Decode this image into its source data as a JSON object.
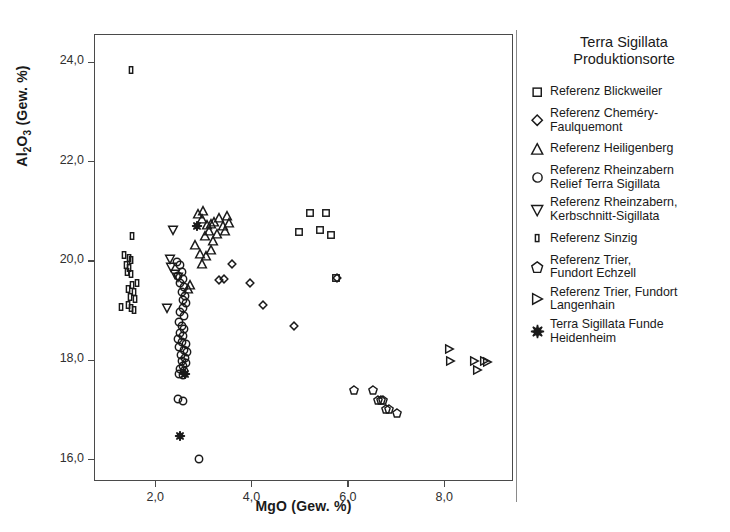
{
  "chart_data": {
    "type": "scatter",
    "title": "",
    "xlabel": "MgO (Gew. %)",
    "ylabel_html": "Al2O3 (Gew. %)",
    "ylabel_main": "Al",
    "ylabel_sub1": "2",
    "ylabel_mid": "O",
    "ylabel_sub2": "3",
    "ylabel_tail": " (Gew. %)",
    "xlim": [
      0.75,
      9.45
    ],
    "ylim": [
      15.55,
      24.55
    ],
    "xticks": [
      2.0,
      4.0,
      6.0,
      8.0
    ],
    "xticklabels": [
      "2,0",
      "4,0",
      "6,0",
      "8,0"
    ],
    "yticks": [
      16.0,
      18.0,
      20.0,
      22.0,
      24.0
    ],
    "yticklabels": [
      "16,0",
      "18,0",
      "20,0",
      "22,0",
      "24,0"
    ],
    "grid": false,
    "legend_position": "right",
    "marker_color": "#1a1a1a",
    "series": [
      {
        "name": "Referenz Blickweiler",
        "marker": "square",
        "points": [
          [
            4.99,
            20.58
          ],
          [
            5.22,
            20.97
          ],
          [
            5.42,
            20.62
          ],
          [
            5.55,
            20.97
          ],
          [
            5.66,
            20.52
          ],
          [
            5.75,
            19.66
          ]
        ]
      },
      {
        "name": "Referenz Chemery-Faulquemont",
        "marker": "diamond",
        "points": [
          [
            3.32,
            19.62
          ],
          [
            3.42,
            19.63
          ],
          [
            3.6,
            19.94
          ],
          [
            3.96,
            19.56
          ],
          [
            4.24,
            19.12
          ],
          [
            4.88,
            18.7
          ],
          [
            5.78,
            19.65
          ]
        ]
      },
      {
        "name": "Referenz Heiligenberg",
        "marker": "triangle-up",
        "points": [
          [
            2.83,
            20.32
          ],
          [
            2.88,
            20.95
          ],
          [
            2.97,
            20.85
          ],
          [
            3.0,
            21.0
          ],
          [
            3.04,
            20.5
          ],
          [
            3.08,
            20.73
          ],
          [
            3.12,
            20.6
          ],
          [
            3.16,
            20.74
          ],
          [
            3.2,
            20.4
          ],
          [
            3.22,
            20.78
          ],
          [
            3.28,
            20.55
          ],
          [
            3.33,
            20.86
          ],
          [
            3.4,
            20.7
          ],
          [
            3.44,
            20.6
          ],
          [
            3.5,
            20.9
          ],
          [
            3.54,
            20.77
          ],
          [
            2.93,
            20.15
          ],
          [
            3.05,
            20.1
          ],
          [
            2.98,
            19.93
          ],
          [
            3.15,
            20.22
          ],
          [
            2.73,
            19.52
          ],
          [
            2.68,
            19.43
          ]
        ]
      },
      {
        "name": "Referenz Rheinzabern Relief Terra Sigillata",
        "marker": "circle",
        "points": [
          [
            2.46,
            19.98
          ],
          [
            2.52,
            19.92
          ],
          [
            2.55,
            19.78
          ],
          [
            2.48,
            19.7
          ],
          [
            2.58,
            19.63
          ],
          [
            2.52,
            19.55
          ],
          [
            2.6,
            19.48
          ],
          [
            2.56,
            19.38
          ],
          [
            2.62,
            19.3
          ],
          [
            2.57,
            19.22
          ],
          [
            2.64,
            19.15
          ],
          [
            2.58,
            19.05
          ],
          [
            2.51,
            18.97
          ],
          [
            2.6,
            18.9
          ],
          [
            2.49,
            18.78
          ],
          [
            2.55,
            18.7
          ],
          [
            2.6,
            18.63
          ],
          [
            2.52,
            18.55
          ],
          [
            2.58,
            18.48
          ],
          [
            2.47,
            18.42
          ],
          [
            2.56,
            18.36
          ],
          [
            2.63,
            18.32
          ],
          [
            2.5,
            18.26
          ],
          [
            2.59,
            18.2
          ],
          [
            2.66,
            18.16
          ],
          [
            2.53,
            18.1
          ],
          [
            2.61,
            18.05
          ],
          [
            2.55,
            17.98
          ],
          [
            2.64,
            17.94
          ],
          [
            2.58,
            17.88
          ],
          [
            2.52,
            17.82
          ],
          [
            2.6,
            17.78
          ],
          [
            2.49,
            17.72
          ],
          [
            2.57,
            17.7
          ],
          [
            2.47,
            17.22
          ],
          [
            2.57,
            17.18
          ],
          [
            2.9,
            16.02
          ]
        ]
      },
      {
        "name": "Referenz Rheinzabern, Kerbschnitt-Sigillata",
        "marker": "triangle-down",
        "points": [
          [
            2.37,
            20.63
          ],
          [
            2.3,
            20.05
          ],
          [
            2.33,
            19.88
          ],
          [
            2.42,
            19.74
          ],
          [
            2.47,
            19.67
          ],
          [
            2.25,
            19.05
          ]
        ]
      },
      {
        "name": "Referenz Sinzig",
        "marker": "rect-tall",
        "points": [
          [
            1.5,
            23.85
          ],
          [
            1.52,
            20.5
          ],
          [
            1.36,
            20.12
          ],
          [
            1.45,
            20.06
          ],
          [
            1.49,
            20.02
          ],
          [
            1.4,
            19.92
          ],
          [
            1.46,
            19.86
          ],
          [
            1.42,
            19.78
          ],
          [
            1.5,
            19.74
          ],
          [
            1.52,
            19.52
          ],
          [
            1.62,
            19.55
          ],
          [
            1.44,
            19.44
          ],
          [
            1.56,
            19.38
          ],
          [
            1.47,
            19.28
          ],
          [
            1.58,
            19.24
          ],
          [
            1.28,
            19.08
          ],
          [
            1.44,
            19.12
          ],
          [
            1.5,
            19.05
          ],
          [
            1.55,
            19.02
          ]
        ]
      },
      {
        "name": "Referenz Trier, Fundort Echzell",
        "marker": "pentagon",
        "points": [
          [
            6.12,
            17.4
          ],
          [
            6.52,
            17.4
          ],
          [
            6.62,
            17.2
          ],
          [
            6.68,
            17.2
          ],
          [
            6.74,
            17.2
          ],
          [
            6.8,
            17.02
          ],
          [
            6.86,
            17.02
          ],
          [
            7.02,
            16.94
          ]
        ]
      },
      {
        "name": "Referenz Trier, Fundort Langenhain",
        "marker": "triangle-right",
        "points": [
          [
            8.1,
            18.22
          ],
          [
            8.12,
            17.98
          ],
          [
            8.62,
            17.98
          ],
          [
            8.82,
            17.99
          ],
          [
            8.88,
            17.97
          ],
          [
            8.68,
            17.8
          ]
        ]
      },
      {
        "name": "Terra Sigillata Funde Heidenheim",
        "marker": "star",
        "points": [
          [
            2.87,
            20.7
          ],
          [
            2.62,
            17.72
          ],
          [
            2.52,
            16.48
          ]
        ]
      }
    ]
  },
  "legend": {
    "title": "Terra Sigillata\nProduktionsorte",
    "items": [
      {
        "label": "Referenz Blickweiler",
        "marker": "square"
      },
      {
        "label": "Referenz Cheméry-\nFaulquemont",
        "marker": "diamond"
      },
      {
        "label": "Referenz Heiligenberg",
        "marker": "triangle-up"
      },
      {
        "label": "Referenz Rheinzabern\nRelief Terra Sigillata",
        "marker": "circle"
      },
      {
        "label": "Referenz Rheinzabern,\nKerbschnitt-Sigillata",
        "marker": "triangle-down"
      },
      {
        "label": "Referenz Sinzig",
        "marker": "rect-tall"
      },
      {
        "label": "Referenz Trier,\nFundort Echzell",
        "marker": "pentagon"
      },
      {
        "label": "Referenz Trier, Fundort\nLangenhain",
        "marker": "triangle-right"
      },
      {
        "label": "Terra Sigillata Funde\nHeidenheim",
        "marker": "star"
      }
    ]
  }
}
